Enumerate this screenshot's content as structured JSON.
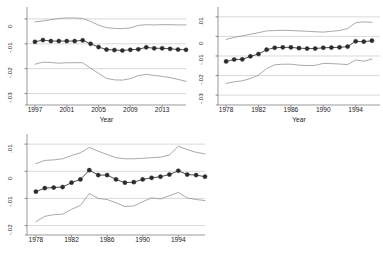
{
  "figure": {
    "background": "#ffffff",
    "line_color": "#3a3a3a",
    "ci_color": "#9a9a9a",
    "grid_color": "#c8c8c8",
    "marker_color": "#2b2b2b",
    "axis_color": "#6e6e6e"
  },
  "chart_data": [
    {
      "id": "panel-top-left",
      "type": "line",
      "title": "",
      "xlabel": "Year",
      "ylabel": "",
      "xlim": [
        1996,
        2016
      ],
      "ylim": [
        -0.033,
        0.004
      ],
      "yticks": [
        0,
        -0.01,
        -0.02,
        -0.03
      ],
      "yticklabels": [
        "0",
        "-.01",
        "-.02",
        "-.03"
      ],
      "xticks": [
        1997,
        2001,
        2005,
        2009,
        2013
      ],
      "xticklabels": [
        "1997",
        "2001",
        "2005",
        "2009",
        "2013"
      ],
      "grid": true,
      "legend": "none",
      "x": [
        1997,
        1998,
        1999,
        2000,
        2001,
        2002,
        2003,
        2004,
        2005,
        2006,
        2007,
        2008,
        2009,
        2010,
        2011,
        2012,
        2013,
        2014,
        2015,
        2016
      ],
      "series": [
        {
          "name": "point estimate",
          "marker": "circle",
          "values": [
            -0.0092,
            -0.0085,
            -0.0089,
            -0.0089,
            -0.0089,
            -0.0089,
            -0.0086,
            -0.01,
            -0.0113,
            -0.0123,
            -0.0125,
            -0.0127,
            -0.0124,
            -0.0122,
            -0.0114,
            -0.0118,
            -0.0118,
            -0.012,
            -0.0123,
            -0.0124
          ]
        },
        {
          "name": "upper 95% CI",
          "marker": "none",
          "values": [
            -0.0012,
            -0.0008,
            -0.0003,
            0.0002,
            0.0004,
            0.0004,
            0.0002,
            -0.001,
            -0.0025,
            -0.0035,
            -0.0038,
            -0.0039,
            -0.0036,
            -0.0026,
            -0.0023,
            -0.0024,
            -0.0023,
            -0.0023,
            -0.0024,
            -0.0024
          ]
        },
        {
          "name": "lower 95% CI",
          "marker": "none",
          "values": [
            -0.0182,
            -0.0174,
            -0.0175,
            -0.0178,
            -0.0176,
            -0.0176,
            -0.0176,
            -0.0198,
            -0.0219,
            -0.0239,
            -0.0245,
            -0.0246,
            -0.024,
            -0.0228,
            -0.0223,
            -0.0227,
            -0.0231,
            -0.0236,
            -0.0243,
            -0.0251
          ]
        }
      ]
    },
    {
      "id": "panel-top-right",
      "type": "line",
      "title": "",
      "xlabel": "Year",
      "ylabel": "",
      "xlim": [
        1977,
        1997
      ],
      "ylim": [
        -0.033,
        0.014
      ],
      "yticks": [
        0.01,
        0,
        -0.01,
        -0.02,
        -0.03
      ],
      "yticklabels": [
        ".01",
        "0",
        "-.01",
        "-.02",
        "-.03"
      ],
      "xticks": [
        1978,
        1982,
        1986,
        1990,
        1994
      ],
      "xticklabels": [
        "1978",
        "1982",
        "1986",
        "1990",
        "1994"
      ],
      "grid": true,
      "legend": "none",
      "x": [
        1978,
        1979,
        1980,
        1981,
        1982,
        1983,
        1984,
        1985,
        1986,
        1987,
        1988,
        1989,
        1990,
        1991,
        1992,
        1993,
        1994,
        1995,
        1996
      ],
      "series": [
        {
          "name": "point estimate",
          "marker": "circle",
          "values": [
            -0.0128,
            -0.0118,
            -0.0117,
            -0.0102,
            -0.009,
            -0.0068,
            -0.0058,
            -0.0056,
            -0.0056,
            -0.006,
            -0.0062,
            -0.0062,
            -0.0058,
            -0.0057,
            -0.0056,
            -0.0052,
            -0.0025,
            -0.0027,
            -0.0022
          ]
        },
        {
          "name": "upper 95% CI",
          "marker": "none",
          "values": [
            -0.0015,
            -0.0005,
            0.0003,
            0.0011,
            0.0019,
            0.0028,
            0.003,
            0.0031,
            0.003,
            0.0028,
            0.0026,
            0.0024,
            0.0022,
            0.0026,
            0.003,
            0.004,
            0.007,
            0.0074,
            0.0072
          ]
        },
        {
          "name": "lower 95% CI",
          "marker": "none",
          "values": [
            -0.024,
            -0.0232,
            -0.0227,
            -0.0215,
            -0.0198,
            -0.0164,
            -0.0145,
            -0.0142,
            -0.0142,
            -0.0147,
            -0.0149,
            -0.0148,
            -0.0138,
            -0.0139,
            -0.0141,
            -0.0144,
            -0.012,
            -0.0127,
            -0.0116
          ]
        }
      ]
    },
    {
      "id": "panel-bottom-left",
      "type": "line",
      "title": "",
      "xlabel": "",
      "ylabel": "",
      "xlim": [
        1977,
        1997
      ],
      "ylim": [
        -0.022,
        0.013
      ],
      "yticks": [
        0.01,
        0,
        -0.01,
        -0.02
      ],
      "yticklabels": [
        ".01",
        "0",
        "-.01",
        "-.02"
      ],
      "xticks": [
        1978,
        1982,
        1986,
        1990,
        1994
      ],
      "xticklabels": [
        "1978",
        "1982",
        "1986",
        "1990",
        "1994"
      ],
      "grid": true,
      "legend": "none",
      "x": [
        1978,
        1979,
        1980,
        1981,
        1982,
        1983,
        1984,
        1985,
        1986,
        1987,
        1988,
        1989,
        1990,
        1991,
        1992,
        1993,
        1994,
        1995,
        1996,
        1997
      ],
      "series": [
        {
          "name": "point estimate",
          "marker": "circle",
          "values": [
            -0.0075,
            -0.0062,
            -0.006,
            -0.0058,
            -0.0042,
            -0.003,
            0.0004,
            -0.0014,
            -0.0014,
            -0.003,
            -0.0042,
            -0.004,
            -0.003,
            -0.0024,
            -0.002,
            -0.0012,
            0.0002,
            -0.0012,
            -0.0014,
            -0.002
          ]
        },
        {
          "name": "upper 95% CI",
          "marker": "none",
          "values": [
            0.0028,
            0.004,
            0.0042,
            0.0046,
            0.0058,
            0.0068,
            0.0088,
            0.0074,
            0.0062,
            0.005,
            0.0046,
            0.0046,
            0.0048,
            0.005,
            0.0052,
            0.006,
            0.0092,
            0.008,
            0.007,
            0.0064
          ]
        },
        {
          "name": "lower 95% CI",
          "marker": "none",
          "values": [
            -0.0186,
            -0.0166,
            -0.016,
            -0.0158,
            -0.014,
            -0.0126,
            -0.0082,
            -0.01,
            -0.0104,
            -0.0116,
            -0.013,
            -0.0128,
            -0.0112,
            -0.0098,
            -0.0102,
            -0.009,
            -0.0078,
            -0.0098,
            -0.0104,
            -0.0108
          ]
        }
      ]
    }
  ]
}
